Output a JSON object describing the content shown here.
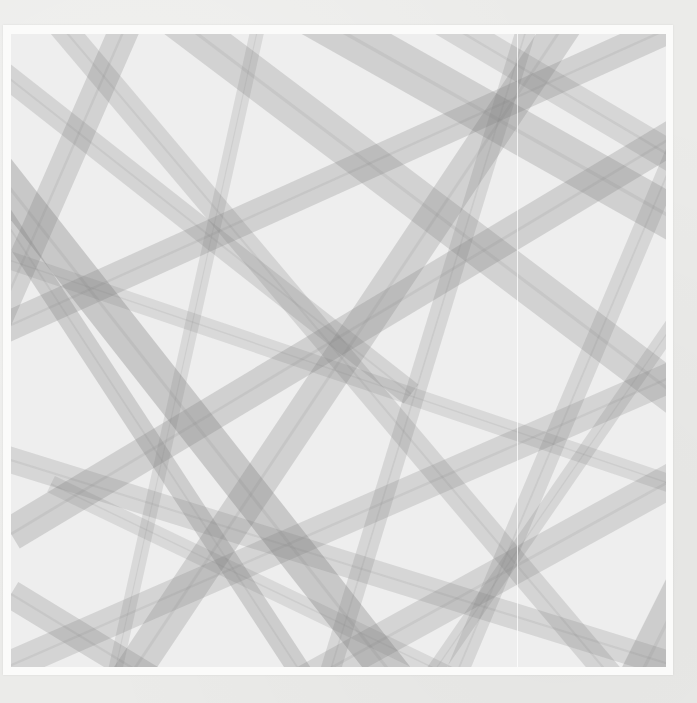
{
  "image": {
    "subject": "abstract artwork of overlapping translucent gray bands",
    "palette": {
      "paper": "#ebebe9",
      "frame": "#fbfbfa",
      "base": "#eeeeee",
      "band": "#7a7a7a"
    },
    "art_area": {
      "x": 11,
      "y": 34,
      "width": 655,
      "height": 633
    },
    "frame_area": {
      "x": 3,
      "y": 25,
      "width": 670,
      "height": 650
    },
    "crease_x": 517,
    "bands": [
      {
        "x1": -20,
        "y1": 130,
        "x2": 420,
        "y2": 690,
        "w": 38,
        "o": 0.32
      },
      {
        "x1": -30,
        "y1": 150,
        "x2": 330,
        "y2": 700,
        "w": 22,
        "o": 0.28
      },
      {
        "x1": 0,
        "y1": 500,
        "x2": 700,
        "y2": 80,
        "w": 34,
        "o": 0.26
      },
      {
        "x1": -20,
        "y1": 300,
        "x2": 690,
        "y2": -20,
        "w": 30,
        "o": 0.25
      },
      {
        "x1": 80,
        "y1": 700,
        "x2": 560,
        "y2": -20,
        "w": 36,
        "o": 0.25
      },
      {
        "x1": 160,
        "y1": -20,
        "x2": 690,
        "y2": 380,
        "w": 40,
        "o": 0.24
      },
      {
        "x1": 300,
        "y1": -20,
        "x2": 690,
        "y2": 200,
        "w": 44,
        "o": 0.26
      },
      {
        "x1": 40,
        "y1": -20,
        "x2": 640,
        "y2": 690,
        "w": 26,
        "o": 0.22
      },
      {
        "x1": -20,
        "y1": 640,
        "x2": 690,
        "y2": 330,
        "w": 30,
        "o": 0.22
      },
      {
        "x1": 200,
        "y1": 700,
        "x2": 690,
        "y2": 430,
        "w": 34,
        "o": 0.22
      },
      {
        "x1": -20,
        "y1": 30,
        "x2": 400,
        "y2": 360,
        "w": 24,
        "o": 0.22
      },
      {
        "x1": 420,
        "y1": 700,
        "x2": 690,
        "y2": 60,
        "w": 22,
        "o": 0.2
      },
      {
        "x1": 520,
        "y1": -20,
        "x2": 300,
        "y2": 700,
        "w": 20,
        "o": 0.2
      },
      {
        "x1": -20,
        "y1": 420,
        "x2": 690,
        "y2": 640,
        "w": 26,
        "o": 0.2
      },
      {
        "x1": 120,
        "y1": -20,
        "x2": -20,
        "y2": 300,
        "w": 30,
        "o": 0.24
      },
      {
        "x1": 600,
        "y1": 700,
        "x2": 690,
        "y2": 520,
        "w": 40,
        "o": 0.28
      },
      {
        "x1": 380,
        "y1": 700,
        "x2": 690,
        "y2": 250,
        "w": 16,
        "o": 0.2
      },
      {
        "x1": 0,
        "y1": 560,
        "x2": 230,
        "y2": 700,
        "w": 28,
        "o": 0.24
      },
      {
        "x1": 250,
        "y1": -20,
        "x2": 90,
        "y2": 700,
        "w": 14,
        "o": 0.18
      },
      {
        "x1": -20,
        "y1": 220,
        "x2": 690,
        "y2": 460,
        "w": 18,
        "o": 0.18
      },
      {
        "x1": 420,
        "y1": -20,
        "x2": 690,
        "y2": 140,
        "w": 30,
        "o": 0.2
      },
      {
        "x1": 560,
        "y1": 700,
        "x2": 40,
        "y2": 450,
        "w": 18,
        "o": 0.18
      }
    ]
  }
}
